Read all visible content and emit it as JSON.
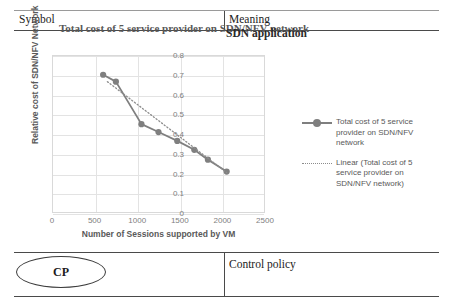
{
  "document": {
    "table": {
      "headers": {
        "symbol": "Symbol",
        "meaning": "Meaning"
      },
      "rows": [
        {
          "symbol": "CP",
          "meaning": "Control policy"
        }
      ],
      "overlapping_text": "SDN application"
    }
  },
  "chart_data": {
    "type": "line",
    "title": "Total cost of 5 service provider on SDN/NFV network",
    "xlabel": "Number of Sessions supported by VM",
    "ylabel": "Relative cost of SDN/NFV Network",
    "xlim": [
      0,
      2500
    ],
    "ylim": [
      0,
      0.8
    ],
    "xticks": [
      0,
      500,
      1000,
      1500,
      2000,
      2500
    ],
    "yticks": [
      "0",
      "0.1",
      "0.2",
      "0.3",
      "0.4",
      "0.5",
      "0.6",
      "0.7",
      "0.8"
    ],
    "grid": true,
    "legend_position": "right",
    "marker_color": "#7f7f7f",
    "line_color": "#7f7f7f",
    "trendline_color": "#8c8c8c",
    "series": [
      {
        "name": "Total cost of 5 service provider on SDN/NFV network",
        "style": "line-marker",
        "x": [
          600,
          750,
          1050,
          1250,
          1470,
          1670,
          1830,
          2050
        ],
        "values": [
          0.7,
          0.665,
          0.45,
          0.41,
          0.365,
          0.32,
          0.27,
          0.21
        ]
      },
      {
        "name": "Linear (Total cost of 5 service provider on SDN/NFV network)",
        "style": "dotted-trendline",
        "x": [
          650,
          2050
        ],
        "values": [
          0.665,
          0.205
        ]
      }
    ],
    "legend": [
      "Total cost of 5 service provider on SDN/NFV network",
      "Linear (Total cost of 5 service provider on SDN/NFV network)"
    ]
  }
}
